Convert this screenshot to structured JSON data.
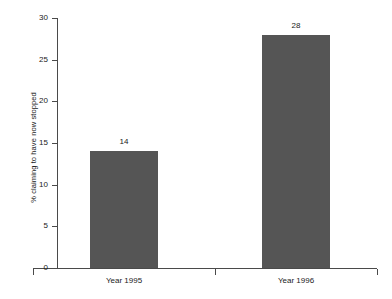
{
  "chart_data": {
    "type": "bar",
    "title": "",
    "subtitle": "",
    "xlabel": "",
    "ylabel": "% claiming to have now stopped",
    "categories": [
      "Year 1995",
      "Year 1996"
    ],
    "values": [
      14,
      28
    ],
    "data_labels": [
      "14",
      "28"
    ],
    "ylim": [
      0,
      30
    ],
    "ytick_labels": [
      "0",
      "5",
      "10",
      "15",
      "20",
      "25",
      "30"
    ],
    "ytick_values": [
      0,
      5,
      10,
      15,
      20,
      25,
      30
    ],
    "grid": false,
    "legend": false,
    "legend_position": "none",
    "bar_color": "#555555",
    "axis_color": "#4a4a4a",
    "background_color": "#ffffff",
    "text_color": "#1a1a1a"
  }
}
